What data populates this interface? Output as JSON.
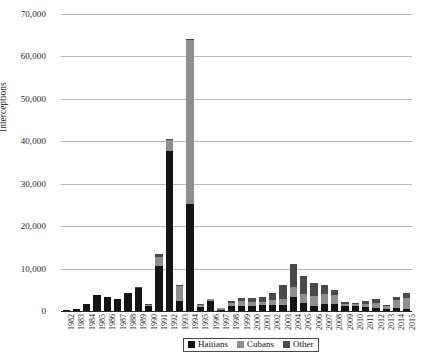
{
  "chart_data": {
    "type": "bar",
    "stacked": true,
    "title": "",
    "xlabel": "",
    "ylabel": "Interceptions",
    "ylim": [
      0,
      70000
    ],
    "ytick_labels": [
      "70,000",
      "60,000",
      "50,000",
      "40,000",
      "30,000",
      "20,000",
      "10,000",
      "0"
    ],
    "ytick_values": [
      70000,
      60000,
      50000,
      40000,
      30000,
      20000,
      10000,
      0
    ],
    "grid": true,
    "legend_position": "bottom",
    "categories": [
      "1982",
      "1983",
      "1984",
      "1985",
      "1986",
      "1987",
      "1988",
      "1989",
      "1990",
      "1991",
      "1992",
      "1993",
      "1994",
      "1995",
      "1996",
      "1997",
      "1998",
      "1999",
      "2000",
      "2001",
      "2002",
      "2003",
      "2004",
      "2005",
      "2006",
      "2007",
      "2008",
      "2009",
      "2010",
      "2011",
      "2012",
      "2013",
      "2014",
      "2015"
    ],
    "series": [
      {
        "name": "Haitians",
        "color": "#141414",
        "values": [
          200,
          500,
          1600,
          3700,
          3400,
          2900,
          4300,
          5500,
          1100,
          10500,
          37600,
          2300,
          25300,
          900,
          2300,
          300,
          1200,
          1100,
          1100,
          1400,
          1500,
          1500,
          3200,
          1800,
          1200,
          1600,
          1600,
          1100,
          1200,
          1000,
          800,
          500,
          700,
          550
        ]
      },
      {
        "name": "Cubans",
        "color": "#8e8e8e",
        "values": [
          0,
          0,
          0,
          0,
          0,
          0,
          0,
          0,
          400,
          2200,
          2600,
          3700,
          38500,
          550,
          450,
          350,
          800,
          1300,
          1100,
          700,
          1200,
          1400,
          2400,
          2100,
          2300,
          2500,
          2200,
          500,
          400,
          650,
          1200,
          600,
          1900,
          2500
        ]
      },
      {
        "name": "Other",
        "color": "#4a4a4a",
        "values": [
          0,
          0,
          0,
          0,
          0,
          0,
          0,
          200,
          100,
          700,
          300,
          200,
          300,
          200,
          200,
          150,
          400,
          700,
          900,
          1100,
          1500,
          3300,
          5600,
          4400,
          3200,
          2000,
          1100,
          600,
          400,
          600,
          900,
          300,
          600,
          1300
        ]
      }
    ]
  },
  "legend": {
    "items": [
      {
        "label": "Haitians",
        "color": "#141414"
      },
      {
        "label": "Cubans",
        "color": "#8e8e8e"
      },
      {
        "label": "Other",
        "color": "#4a4a4a"
      }
    ]
  }
}
